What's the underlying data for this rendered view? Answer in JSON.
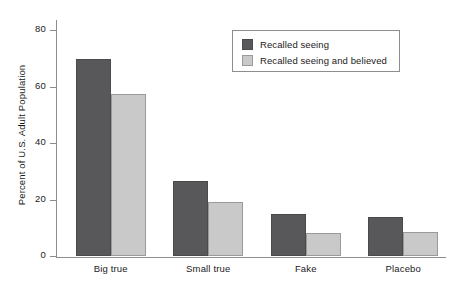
{
  "chart_data": {
    "type": "bar",
    "title": "",
    "subtitle": "",
    "xlabel": "",
    "ylabel": "Percent of U.S. Adult Population",
    "categories": [
      "Big true",
      "Small true",
      "Fake",
      "Placebo"
    ],
    "series": [
      {
        "name": "Recalled seeing",
        "color": "#58585a",
        "values": [
          70,
          26.5,
          15,
          14
        ]
      },
      {
        "name": "Recalled seeing and believed",
        "color": "#c9c9c9",
        "values": [
          57.5,
          19,
          8,
          8.5
        ]
      }
    ],
    "ylim": [
      0,
      84
    ],
    "yticks": [
      0,
      20,
      40,
      60,
      80
    ],
    "ytick_labels": [
      "0",
      "20",
      "40",
      "60",
      "80"
    ],
    "grid": false,
    "legend_position": "top-right",
    "annotations": []
  },
  "legend": {
    "entries": [
      {
        "label": "Recalled seeing"
      },
      {
        "label": "Recalled seeing and believed"
      }
    ]
  }
}
